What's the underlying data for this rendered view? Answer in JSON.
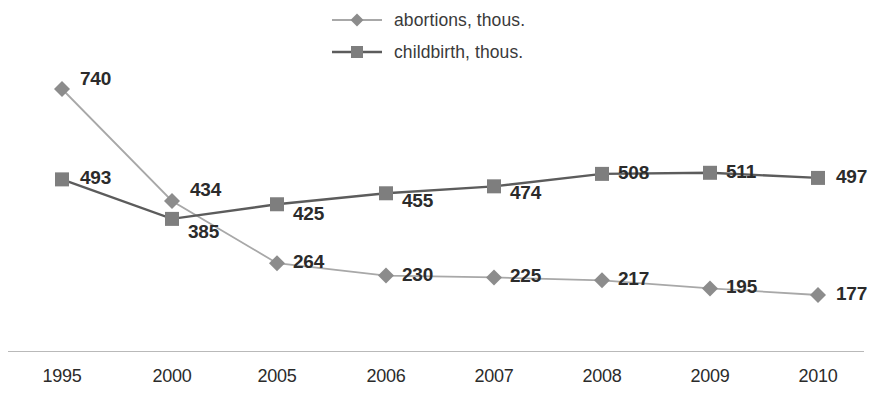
{
  "chart_data": {
    "type": "line",
    "title": "",
    "subtitle": "",
    "xlabel": "",
    "ylabel": "",
    "grid": false,
    "legend_position": "top-center",
    "axis_visible": {
      "x": true,
      "y": false
    },
    "categories": [
      "1995",
      "2000",
      "2005",
      "2006",
      "2007",
      "2008",
      "2009",
      "2010"
    ],
    "ylim": [
      0,
      800
    ],
    "data_labels_shown": true,
    "series": [
      {
        "name": "abortions, thous.",
        "marker": "diamond",
        "line_color": "#a8a8a8",
        "marker_color": "#8c8c8c",
        "values": [
          740,
          434,
          264,
          230,
          225,
          217,
          195,
          177
        ],
        "labels": [
          "740",
          "434",
          "264",
          "230",
          "225",
          "217",
          "195",
          "177"
        ]
      },
      {
        "name": "childbirth, thous.",
        "marker": "square",
        "line_color": "#5c5c5c",
        "marker_color": "#7e7e7e",
        "values": [
          493,
          385,
          425,
          455,
          474,
          508,
          511,
          497
        ],
        "labels": [
          "493",
          "385",
          "425",
          "455",
          "474",
          "508",
          "511",
          "497"
        ]
      }
    ]
  },
  "legend": {
    "items": [
      {
        "label": "abortions, thous.",
        "marker": "diamond-marker-icon"
      },
      {
        "label": "childbirth, thous.",
        "marker": "square-marker-icon"
      }
    ]
  },
  "axis": {
    "x_tick_labels": [
      "1995",
      "2000",
      "2005",
      "2006",
      "2007",
      "2008",
      "2009",
      "2010"
    ]
  },
  "colors": {
    "abortions_line": "#a8a8a8",
    "abortions_marker": "#8c8c8c",
    "childbirth_line": "#5c5c5c",
    "childbirth_marker": "#7e7e7e",
    "axis": "#b9b9b9",
    "text": "#2b2b2b",
    "background": "#ffffff"
  },
  "layout": {
    "x_positions": [
      62,
      172,
      277,
      386,
      494,
      602,
      710,
      818
    ],
    "series_label_offsets": {
      "abortions": [
        {
          "dx": 18,
          "dy": -21
        },
        {
          "dx": 18,
          "dy": -22
        },
        {
          "dx": 16,
          "dy": -12
        },
        {
          "dx": 16,
          "dy": -12
        },
        {
          "dx": 16,
          "dy": -12
        },
        {
          "dx": 16,
          "dy": -12
        },
        {
          "dx": 16,
          "dy": -12
        },
        {
          "dx": 18,
          "dy": -12
        }
      ],
      "childbirth": [
        {
          "dx": 18,
          "dy": -12
        },
        {
          "dx": 16,
          "dy": 2
        },
        {
          "dx": 16,
          "dy": -1
        },
        {
          "dx": 16,
          "dy": -3
        },
        {
          "dx": 16,
          "dy": -4
        },
        {
          "dx": 16,
          "dy": -12
        },
        {
          "dx": 16,
          "dy": -12
        },
        {
          "dx": 18,
          "dy": -12
        }
      ]
    }
  }
}
